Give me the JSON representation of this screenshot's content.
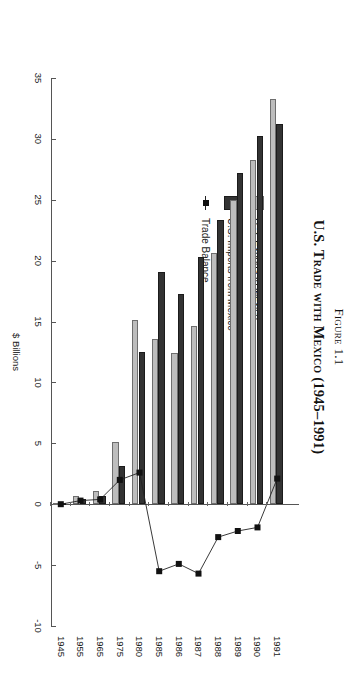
{
  "figure": {
    "number_label": "Figure 1.1",
    "title": "U.S. Trade with Mexico (1945–1991)"
  },
  "legend": {
    "items": [
      {
        "label": "U.S. Exports to Mexico",
        "marker": "filled-square-light",
        "color": "#bdbdbd"
      },
      {
        "label": "U.S. Imports from Mexico",
        "marker": "filled-square-dark",
        "color": "#333333"
      },
      {
        "label": "Trade Balance",
        "marker": "line-with-square",
        "color": "#111111"
      }
    ]
  },
  "chart_data": {
    "type": "bar",
    "orientation": "horizontal",
    "title": "U.S. Trade with Mexico (1945–1991)",
    "subtitle": "Figure 1.1",
    "xlabel": "",
    "ylabel": "$ Billions",
    "value_axis_label": "$ Billions",
    "categories": [
      "1945",
      "1955",
      "1965",
      "1975",
      "1980",
      "1985",
      "1986",
      "1987",
      "1988",
      "1989",
      "1990",
      "1991"
    ],
    "series": [
      {
        "name": "U.S. Exports to Mexico",
        "type": "bar",
        "color": "#bdbdbd",
        "values": [
          0.1,
          0.7,
          1.1,
          5.1,
          15.1,
          13.6,
          12.4,
          14.6,
          20.6,
          25.0,
          28.3,
          33.3
        ]
      },
      {
        "name": "U.S. Imports from Mexico",
        "type": "bar",
        "color": "#333333",
        "values": [
          0.1,
          0.4,
          0.7,
          3.1,
          12.5,
          19.1,
          17.3,
          20.3,
          23.3,
          27.2,
          30.2,
          31.2
        ]
      },
      {
        "name": "Trade Balance",
        "type": "line",
        "color": "#111111",
        "values": [
          0.0,
          0.3,
          0.4,
          2.0,
          2.6,
          -5.5,
          -4.9,
          -5.7,
          -2.7,
          -2.2,
          -1.9,
          2.1
        ]
      }
    ],
    "ticks": [
      35,
      30,
      25,
      20,
      15,
      10,
      5,
      0,
      -5,
      -10
    ],
    "xlim": [
      -10,
      35
    ],
    "grid": false,
    "legend_position": "left-inside"
  },
  "axis": {
    "value_ticks": [
      "35",
      "30",
      "25",
      "20",
      "15",
      "10",
      "5",
      "0",
      "-5",
      "-10"
    ],
    "value_title": "$ Billions",
    "category_ticks": [
      "1945",
      "1955",
      "1965",
      "1975",
      "1980",
      "1985",
      "1986",
      "1987",
      "1988",
      "1989",
      "1990",
      "1991"
    ]
  }
}
